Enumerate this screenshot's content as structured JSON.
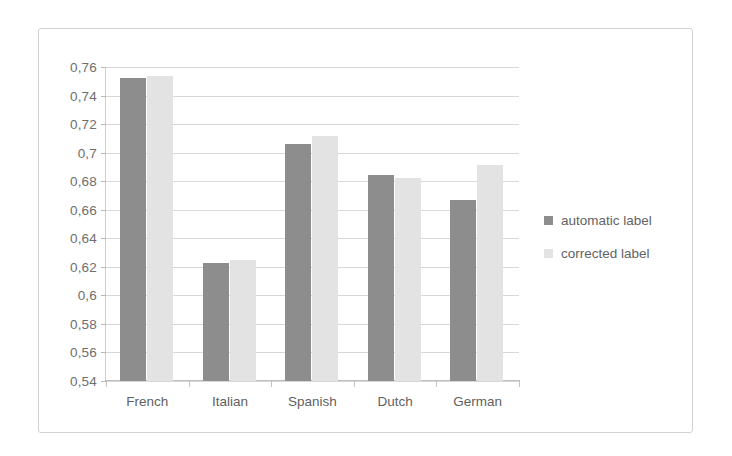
{
  "chart_data": {
    "type": "bar",
    "title": "",
    "xlabel": "",
    "ylabel": "",
    "categories": [
      "French",
      "Italian",
      "Spanish",
      "Dutch",
      "German"
    ],
    "series": [
      {
        "name": "automatic label",
        "color": "#8d8d8d",
        "values": [
          0.752,
          0.623,
          0.706,
          0.684,
          0.667
        ]
      },
      {
        "name": "corrected label",
        "color": "#e3e3e3",
        "values": [
          0.754,
          0.625,
          0.712,
          0.682,
          0.691
        ]
      }
    ],
    "ylim": [
      0.54,
      0.76
    ],
    "ytick_step": 0.02,
    "ytick_labels": [
      "0,76",
      "0,74",
      "0,72",
      "0,7",
      "0,68",
      "0,66",
      "0,64",
      "0,62",
      "0,6",
      "0,58",
      "0,56",
      "0,54"
    ],
    "ytick_values": [
      0.76,
      0.74,
      0.72,
      0.7,
      0.68,
      0.66,
      0.64,
      0.62,
      0.6,
      0.58,
      0.56,
      0.54
    ],
    "decimal_separator": ",",
    "grid": true,
    "legend_position": "right",
    "legend": [
      "automatic label",
      "corrected label"
    ]
  },
  "colors": {
    "automatic": "#8d8d8d",
    "corrected": "#e3e3e3",
    "grid": "#d8d8d8",
    "frame": "#d2d2d2",
    "text": "#6e6e6e"
  }
}
